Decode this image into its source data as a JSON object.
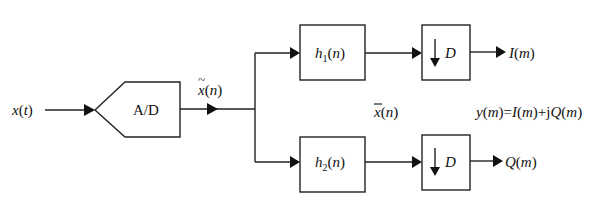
{
  "diagram": {
    "type": "block-diagram",
    "input": {
      "signal": "x(t)",
      "var": "x",
      "arg": "t"
    },
    "adc": {
      "label": "A/D"
    },
    "sampled_signal": {
      "label": "x̃(n)",
      "var": "x",
      "arg": "n",
      "accent": "~"
    },
    "filtered_label": {
      "var": "x",
      "arg": "n",
      "accent": "‾",
      "label": "x̄(n)"
    },
    "branches": [
      {
        "filter": {
          "label": "h1(n)",
          "name": "h",
          "sub": "1",
          "arg": "n"
        },
        "decimator": {
          "arrow": "↓",
          "factor": "D"
        },
        "output": {
          "name": "I",
          "arg": "m",
          "label": "I(m)"
        }
      },
      {
        "filter": {
          "label": "h2(n)",
          "name": "h",
          "sub": "2",
          "arg": "n"
        },
        "decimator": {
          "arrow": "↓",
          "factor": "D"
        },
        "output": {
          "name": "Q",
          "arg": "m",
          "label": "Q(m)"
        }
      }
    ],
    "equation": {
      "label": "y(m)=I(m)+jQ(m)"
    },
    "colors": {
      "line": "#222222",
      "background": "#ffffff"
    }
  }
}
